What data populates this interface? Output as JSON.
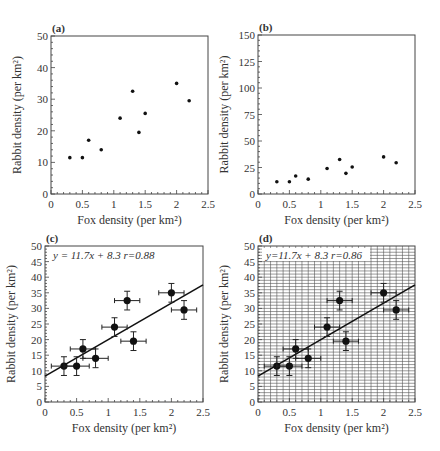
{
  "chart_data": [
    {
      "panel": "(a)",
      "type": "scatter",
      "xlabel": "Fox density (per km²)",
      "ylabel": "Rabbit density (per km²)",
      "xlim": [
        0,
        2.5
      ],
      "ylim": [
        0,
        50
      ],
      "xticks": [
        "0",
        "0.5",
        "1",
        "1.5",
        "2",
        "2.5"
      ],
      "yticks": [
        "0",
        "10",
        "20",
        "30",
        "40",
        "50"
      ],
      "grid": false,
      "x": [
        0.3,
        0.5,
        0.6,
        0.8,
        1.1,
        1.3,
        1.4,
        1.5,
        2.0,
        2.2
      ],
      "y": [
        11.5,
        11.5,
        17,
        14,
        24,
        32.5,
        19.5,
        25.5,
        35,
        29.5
      ]
    },
    {
      "panel": "(b)",
      "type": "scatter",
      "xlabel": "Fox density (per km²)",
      "ylabel": "Rabbit density (per km²)",
      "xlim": [
        0,
        2.5
      ],
      "ylim": [
        0,
        150
      ],
      "xticks": [
        "0",
        "0.5",
        "1",
        "1.5",
        "2",
        "2.5"
      ],
      "yticks": [
        "0",
        "25",
        "50",
        "75",
        "100",
        "125",
        "150"
      ],
      "grid": false,
      "x": [
        0.3,
        0.5,
        0.6,
        0.8,
        1.1,
        1.3,
        1.4,
        1.5,
        2.0,
        2.2
      ],
      "y": [
        11.5,
        11.5,
        17,
        14,
        24,
        32.5,
        19.5,
        25.5,
        35,
        29.5
      ]
    },
    {
      "panel": "(c)",
      "type": "scatter",
      "xlabel": "Fox density (per km²)",
      "ylabel": "Rabbit density (per km²)",
      "xlim": [
        0,
        2.5
      ],
      "ylim": [
        0,
        50
      ],
      "xticks": [
        "0",
        "0.5",
        "1",
        "1.5",
        "2",
        "2.5"
      ],
      "yticks": [
        "0",
        "5",
        "10",
        "15",
        "20",
        "25",
        "30",
        "35",
        "40",
        "45",
        "50"
      ],
      "grid": false,
      "annotation": "y = 11.7x + 8.3  r=0.88",
      "fit": {
        "slope": 11.7,
        "intercept": 8.3,
        "r": 0.88
      },
      "x": [
        0.3,
        0.5,
        0.6,
        0.8,
        1.1,
        1.3,
        1.4,
        2.0,
        2.2
      ],
      "y": [
        11.5,
        11.5,
        17,
        14,
        24,
        32.5,
        19.5,
        35,
        29.5
      ],
      "xerr": 0.2,
      "yerr": 3
    },
    {
      "panel": "(d)",
      "type": "scatter",
      "xlabel": "Fox density (per km²)",
      "ylabel": "Rabbit density (per km²)",
      "xlim": [
        0,
        2.5
      ],
      "ylim": [
        0,
        50
      ],
      "xticks": [
        "0",
        "0.5",
        "1",
        "1.5",
        "2",
        "2.5"
      ],
      "yticks": [
        "0",
        "5",
        "10",
        "15",
        "20",
        "25",
        "30",
        "35",
        "40",
        "45",
        "50"
      ],
      "grid": true,
      "annotation": "y=11.7x + 8.3  r=0.86",
      "fit": {
        "slope": 11.7,
        "intercept": 8.3,
        "r": 0.86
      },
      "x": [
        0.3,
        0.5,
        0.6,
        0.8,
        1.1,
        1.3,
        1.4,
        2.0,
        2.2
      ],
      "y": [
        11.5,
        11.5,
        17,
        14,
        24,
        32.5,
        19.5,
        35,
        29.5
      ],
      "xerr": 0.2,
      "yerr": 3
    }
  ],
  "layout": [
    {
      "left": 51,
      "top": 36,
      "right": 208,
      "bottom": 194
    },
    {
      "left": 258,
      "top": 35,
      "right": 415,
      "bottom": 194
    },
    {
      "left": 45,
      "top": 246,
      "right": 203,
      "bottom": 402
    },
    {
      "left": 258,
      "top": 246,
      "right": 415,
      "bottom": 402
    }
  ]
}
